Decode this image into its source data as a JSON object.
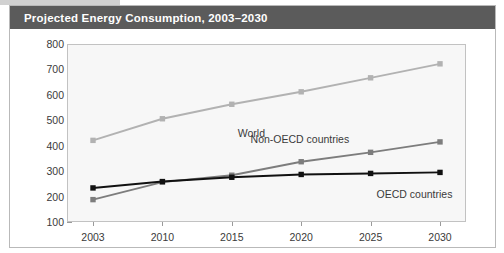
{
  "figure": {
    "title": "Projected Energy Consumption, 2003–2030",
    "title_bar_color": "#5b5b5b",
    "title_text_color": "#ffffff",
    "frame_border_color": "#b9b9b9",
    "plot_background": "#f7f7f7",
    "plot_border_color": "#c2c2c2"
  },
  "chart_data": {
    "type": "line",
    "title": "Projected Energy Consumption, 2003–2030",
    "subtitle": "",
    "xlabel": "",
    "ylabel": "Quadrillion BTUs",
    "categories": [
      "2003",
      "2010",
      "2015",
      "2020",
      "2025",
      "2030"
    ],
    "ylim": [
      100,
      800
    ],
    "yticks": [
      100,
      200,
      300,
      400,
      500,
      600,
      700,
      800
    ],
    "ytick_labels": [
      "100",
      "200",
      "300",
      "400",
      "500",
      "600",
      "700",
      "800"
    ],
    "grid": false,
    "legend_position": "inline-annotations",
    "series": [
      {
        "name": "World",
        "color": "#b2b2b2",
        "marker": "square",
        "values": [
          421,
          506,
          563,
          612,
          667,
          722
        ]
      },
      {
        "name": "Non-OECD countries",
        "color": "#7d7d7d",
        "marker": "square",
        "values": [
          188,
          257,
          284,
          337,
          374,
          415
        ]
      },
      {
        "name": "OECD countries",
        "color": "#111111",
        "marker": "square",
        "values": [
          234,
          259,
          276,
          287,
          291,
          295
        ]
      }
    ],
    "annotations": [
      {
        "text": "World",
        "x_category": "2015",
        "value": 563,
        "dx": 6,
        "dy": 30
      },
      {
        "text": "Non-OECD countries",
        "x_category": "2025",
        "value": 374,
        "dx": -120,
        "dy": -12
      },
      {
        "text": "OECD countries",
        "x_category": "2025",
        "value": 291,
        "dx": 6,
        "dy": 22
      }
    ]
  }
}
